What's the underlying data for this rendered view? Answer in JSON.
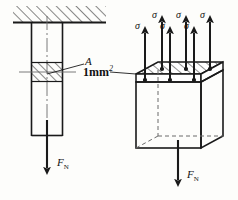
{
  "figure": {
    "labels": {
      "area_label": "A",
      "unit_area": "1mm",
      "unit_area_exp": "2",
      "force_left": "F",
      "force_left_sub": "N",
      "force_right": "F",
      "force_right_sub": "N",
      "sigma": "σ"
    },
    "stress_arrows": [
      {
        "name": "sigma-arrow-back-1",
        "label": "σ"
      },
      {
        "name": "sigma-arrow-front-1",
        "label": "σ"
      },
      {
        "name": "sigma-arrow-back-2",
        "label": "σ"
      },
      {
        "name": "sigma-arrow-front-2",
        "label": "σ"
      },
      {
        "name": "sigma-arrow-back-3",
        "label": "σ"
      },
      {
        "name": "sigma-arrow-front-3",
        "label": "σ"
      }
    ],
    "colors": {
      "ink": "#1a1a1a",
      "hatch": "#222222",
      "hidden": "#6b6b6b",
      "centerline": "#6b6b6b",
      "background": "#fdfdfb"
    }
  }
}
